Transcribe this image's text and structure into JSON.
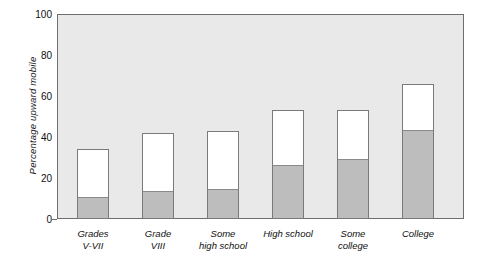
{
  "chart_data": {
    "type": "bar",
    "stacked": true,
    "title": "",
    "xlabel": "",
    "ylabel": "Percentage upward mobile",
    "ylim": [
      0,
      100
    ],
    "yticks": [
      0,
      20,
      40,
      60,
      80,
      100
    ],
    "grid": false,
    "legend": "none",
    "categories": [
      "Grades V-VII",
      "Grade VIII",
      "Some high school",
      "High school",
      "Some college",
      "College"
    ],
    "category_lines": [
      [
        "Grades",
        "V-VII"
      ],
      [
        "Grade",
        "VIII"
      ],
      [
        "Some",
        "high school"
      ],
      [
        "High school",
        ""
      ],
      [
        "Some",
        "college"
      ],
      [
        "College",
        ""
      ]
    ],
    "series": [
      {
        "name": "lower segment",
        "color": "#bdbdbd",
        "values": [
          10,
          13,
          14,
          26,
          29,
          43
        ]
      },
      {
        "name": "upper segment",
        "color": "#ffffff",
        "values": [
          24,
          29,
          29,
          27,
          24,
          23
        ]
      }
    ],
    "totals": [
      34,
      42,
      43,
      53,
      53,
      66
    ]
  },
  "style": {
    "plot_background": "#e9e9e9",
    "frame_color": "#6e6e6e",
    "bar_outline": "#7a7a7a",
    "fill_color": "#bdbdbd",
    "empty_color": "#ffffff",
    "text_color": "#111111"
  }
}
